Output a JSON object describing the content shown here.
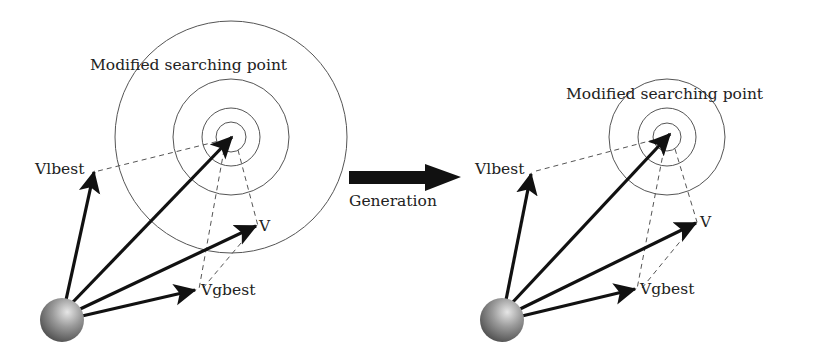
{
  "diagram": {
    "type": "pso-search-point-generation",
    "colors": {
      "background": "#ffffff",
      "stroke": "#111111",
      "circle_stroke": "#555555",
      "dash_stroke": "#555555",
      "sphere_light": "#d9d9d9",
      "sphere_dark": "#5a5a5a"
    },
    "left_panel": {
      "title": "Modified searching point",
      "labels": {
        "vlbest": "Vlbest",
        "v": "V",
        "vgbest": "Vgbest"
      }
    },
    "transition": {
      "label": "Generation"
    },
    "right_panel": {
      "title": "Modified searching point",
      "labels": {
        "vlbest": "Vlbest",
        "v": "V",
        "vgbest": "Vgbest"
      }
    }
  }
}
